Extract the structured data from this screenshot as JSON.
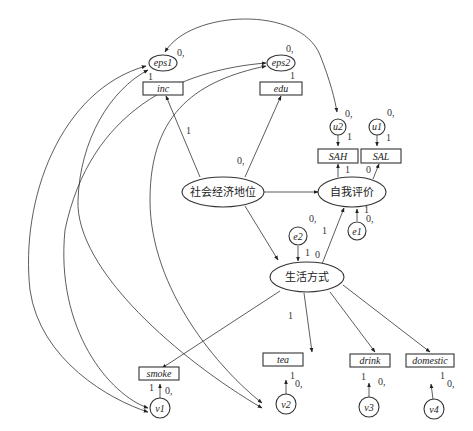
{
  "diagram": {
    "type": "structural-equation-model",
    "latent_variables": [
      {
        "id": "ses",
        "label": "社会经济地位"
      },
      {
        "id": "selfeval",
        "label": "自我评价"
      },
      {
        "id": "lifestyle",
        "label": "生活方式"
      }
    ],
    "observed_variables": [
      {
        "id": "inc",
        "label": "inc"
      },
      {
        "id": "edu",
        "label": "edu"
      },
      {
        "id": "SAH",
        "label": "SAH"
      },
      {
        "id": "SAL",
        "label": "SAL"
      },
      {
        "id": "smoke",
        "label": "smoke"
      },
      {
        "id": "tea",
        "label": "tea"
      },
      {
        "id": "drink",
        "label": "drink"
      },
      {
        "id": "domestic",
        "label": "domestic"
      }
    ],
    "error_terms": [
      {
        "id": "eps1",
        "label": "eps1",
        "variance_label": "0,",
        "path_label": "1"
      },
      {
        "id": "eps2",
        "label": "eps2",
        "variance_label": "0,",
        "path_label": "1"
      },
      {
        "id": "u2",
        "label": "u2",
        "variance_label": "0,",
        "path_label": "1"
      },
      {
        "id": "u1",
        "label": "u1",
        "variance_label": "0,",
        "path_label": "1"
      },
      {
        "id": "e2",
        "label": "e2",
        "variance_label": "0,",
        "path_label": "1"
      },
      {
        "id": "e1",
        "label": "e1",
        "variance_label": "0,",
        "path_label": "1"
      },
      {
        "id": "v1",
        "label": "v1",
        "variance_label": "0,",
        "path_label": "1"
      },
      {
        "id": "v2",
        "label": "v2",
        "variance_label": "0,",
        "path_label": "1"
      },
      {
        "id": "v3",
        "label": "v3",
        "variance_label": "0,",
        "path_label": "1"
      },
      {
        "id": "v4",
        "label": "v4",
        "variance_label": "0,",
        "path_label": "1"
      }
    ],
    "paths": [
      {
        "from": "社会经济地位",
        "to": "inc",
        "label": "1"
      },
      {
        "from": "社会经济地位",
        "to": "edu",
        "label": "0,"
      },
      {
        "from": "社会经济地位",
        "to": "自我评价",
        "label": ""
      },
      {
        "from": "社会经济地位",
        "to": "生活方式",
        "label": ""
      },
      {
        "from": "自我评价",
        "to": "SAH",
        "label": "1"
      },
      {
        "from": "自我评价",
        "to": "SAL",
        "label": "0"
      },
      {
        "from": "生活方式",
        "to": "自我评价",
        "label": "0"
      },
      {
        "from": "生活方式",
        "to": "smoke",
        "label": ""
      },
      {
        "from": "生活方式",
        "to": "tea",
        "label": "1"
      },
      {
        "from": "生活方式",
        "to": "drink",
        "label": ""
      },
      {
        "from": "生活方式",
        "to": "domestic",
        "label": ""
      }
    ],
    "covariances": [
      {
        "a": "eps1",
        "b": "u2"
      },
      {
        "a": "eps1",
        "b": "v1"
      },
      {
        "a": "eps1",
        "b": "v2"
      },
      {
        "a": "eps2",
        "b": "v1"
      },
      {
        "a": "eps2",
        "b": "v2"
      }
    ],
    "labels": {
      "zero_comma": "0,",
      "one": "1",
      "zero": "0"
    }
  }
}
